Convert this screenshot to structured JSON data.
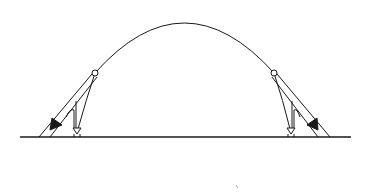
{
  "diagram": {
    "type": "projectile-trajectory",
    "colors": {
      "background": "#ffffff",
      "stroke": "#1a1a1a"
    },
    "ground": {
      "x1": 20,
      "x2": 351,
      "y": 137
    },
    "arc": {
      "start_x": 95,
      "start_y": 73,
      "apex_x": 183,
      "apex_y": 23,
      "end_x": 274,
      "end_y": 73
    },
    "points": [
      {
        "id": "left-point",
        "x": 95,
        "y": 73,
        "shape": "open-circle"
      },
      {
        "id": "right-point",
        "x": 274,
        "y": 73,
        "shape": "open-circle"
      }
    ],
    "arrows": [
      {
        "id": "left-diagonal-arrow",
        "style": "double-line-filled-head",
        "direction": "down-left"
      },
      {
        "id": "left-vertical-arrow",
        "style": "open-head",
        "direction": "down"
      },
      {
        "id": "right-diagonal-arrow",
        "style": "double-line-filled-head",
        "direction": "down-right"
      },
      {
        "id": "right-vertical-arrow",
        "style": "open-head",
        "direction": "down"
      }
    ]
  }
}
